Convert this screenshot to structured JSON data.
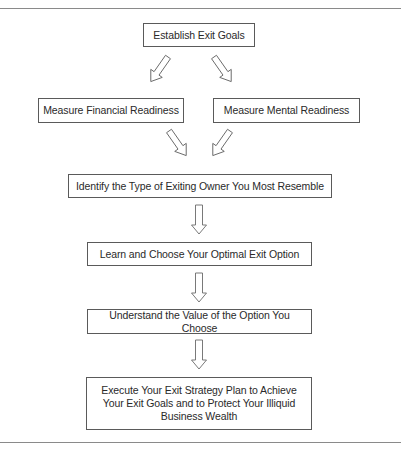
{
  "diagram": {
    "type": "flowchart",
    "nodes": [
      {
        "id": "goals",
        "label": "Establish Exit Goals"
      },
      {
        "id": "financial",
        "label": "Measure Financial Readiness"
      },
      {
        "id": "mental",
        "label": "Measure Mental Readiness"
      },
      {
        "id": "identify",
        "label": "Identify the Type of Exiting Owner You Most Resemble"
      },
      {
        "id": "learn",
        "label": "Learn and Choose Your Optimal Exit Option"
      },
      {
        "id": "understand",
        "label": "Understand the Value of the Option You Choose"
      },
      {
        "id": "execute",
        "label": "Execute Your Exit Strategy Plan to Achieve Your Exit Goals and to Protect Your Illiquid Business Wealth"
      }
    ],
    "edges": [
      {
        "from": "goals",
        "to": "financial"
      },
      {
        "from": "goals",
        "to": "mental"
      },
      {
        "from": "financial",
        "to": "identify"
      },
      {
        "from": "mental",
        "to": "identify"
      },
      {
        "from": "identify",
        "to": "learn"
      },
      {
        "from": "learn",
        "to": "understand"
      },
      {
        "from": "understand",
        "to": "execute"
      }
    ],
    "arrow_style": "hollow-block-arrow",
    "colors": {
      "border": "#5a5a5a",
      "arrow_stroke": "#6a6a6a",
      "rule": "#8a8a8a",
      "background": "#ffffff"
    }
  }
}
